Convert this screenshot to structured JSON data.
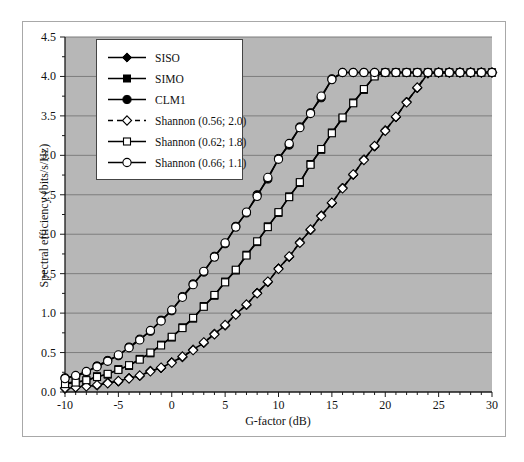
{
  "figure": {
    "background": "#ffffff",
    "frame_border": "#a8a8a8",
    "plot_bg": "#b7b7b7",
    "gridline_color": "#7d7d7d",
    "axis_color": "#1a1a1a",
    "series_color": "#000000"
  },
  "chart_data": {
    "type": "line",
    "title": "",
    "xlabel": "G-factor (dB)",
    "ylabel": "Spectral efficiency (bits/s/Hz)",
    "xlim": [
      -10,
      30
    ],
    "ylim": [
      0,
      4.5
    ],
    "grid": "horizontal-major",
    "legend_position": "top-left-inside",
    "x_ticks": {
      "values": [
        -10,
        -5,
        0,
        5,
        10,
        15,
        20,
        25,
        30
      ],
      "labels": [
        "-10",
        "-5",
        "0",
        "5",
        "10",
        "15",
        "20",
        "25",
        "30"
      ],
      "minor_step": 1
    },
    "y_ticks": {
      "values": [
        0,
        0.5,
        1,
        1.5,
        2,
        2.5,
        3,
        3.5,
        4,
        4.5
      ],
      "labels": [
        "0.0",
        "0.5",
        "1.0",
        "1.5",
        "2.0",
        "2.5",
        "3.0",
        "3.5",
        "4.0",
        "4.5"
      ],
      "minor_step": 0.25
    },
    "x": [
      -10,
      -9,
      -8,
      -7,
      -6,
      -5,
      -4,
      -3,
      -2,
      -1,
      0,
      1,
      2,
      3,
      4,
      5,
      6,
      7,
      8,
      9,
      10,
      11,
      12,
      13,
      14,
      15,
      16,
      17,
      18,
      19,
      20,
      21,
      22,
      23,
      24,
      25,
      26,
      27,
      28,
      29,
      30
    ],
    "saturation_level": 4.05,
    "series": [
      {
        "name": "SISO",
        "marker": "diamond",
        "marker_fill": "filled",
        "line": "solid",
        "values": [
          0.04,
          0.06,
          0.08,
          0.08,
          0.12,
          0.13,
          0.18,
          0.2,
          0.27,
          0.3,
          0.38,
          0.44,
          0.54,
          0.62,
          0.74,
          0.84,
          0.99,
          1.1,
          1.26,
          1.39,
          1.57,
          1.71,
          1.9,
          2.05,
          2.24,
          2.39,
          2.59,
          2.75,
          2.95,
          3.11,
          3.32,
          3.48,
          3.68,
          3.85,
          4.04,
          4.05,
          4.05,
          4.05,
          4.05,
          4.05,
          4.05
        ]
      },
      {
        "name": "SIMO",
        "marker": "square",
        "marker_fill": "filled",
        "line": "solid",
        "values": [
          0.11,
          0.13,
          0.14,
          0.2,
          0.22,
          0.29,
          0.33,
          0.42,
          0.49,
          0.6,
          0.69,
          0.82,
          0.93,
          1.09,
          1.22,
          1.4,
          1.54,
          1.74,
          1.9,
          2.1,
          2.27,
          2.48,
          2.65,
          2.89,
          3.07,
          3.29,
          3.47,
          3.67,
          3.83,
          4.01,
          4.05,
          4.05,
          4.05,
          4.05,
          4.05,
          4.05,
          4.05,
          4.05,
          4.05,
          4.05,
          4.05
        ]
      },
      {
        "name": "CLM1",
        "marker": "circle",
        "marker_fill": "filled",
        "line": "solid",
        "values": [
          0.18,
          0.2,
          0.25,
          0.33,
          0.4,
          0.46,
          0.57,
          0.67,
          0.77,
          0.91,
          1.03,
          1.21,
          1.37,
          1.52,
          1.72,
          1.88,
          2.1,
          2.27,
          2.5,
          2.7,
          2.96,
          3.13,
          3.36,
          3.54,
          3.73,
          3.97,
          4.05,
          4.05,
          4.05,
          4.05,
          4.05,
          4.05,
          4.05,
          4.05,
          4.05,
          4.05,
          4.05,
          4.05,
          4.05,
          4.05,
          4.05
        ]
      },
      {
        "name": "Shannon (0.56; 2.0)",
        "marker": "diamond",
        "marker_fill": "open",
        "line": "dashed",
        "values": [
          0.05,
          0.06,
          0.07,
          0.09,
          0.11,
          0.14,
          0.17,
          0.21,
          0.26,
          0.31,
          0.37,
          0.45,
          0.53,
          0.63,
          0.73,
          0.85,
          0.98,
          1.11,
          1.25,
          1.4,
          1.56,
          1.72,
          1.89,
          2.06,
          2.23,
          2.4,
          2.58,
          2.76,
          2.94,
          3.12,
          3.31,
          3.49,
          3.67,
          3.86,
          4.04,
          4.05,
          4.05,
          4.05,
          4.05,
          4.05,
          4.05
        ]
      },
      {
        "name": "Shannon (0.62; 1.8)",
        "marker": "square",
        "marker_fill": "open",
        "line": "solid",
        "values": [
          0.1,
          0.12,
          0.15,
          0.19,
          0.23,
          0.28,
          0.34,
          0.41,
          0.5,
          0.59,
          0.7,
          0.81,
          0.94,
          1.08,
          1.23,
          1.39,
          1.55,
          1.73,
          1.91,
          2.09,
          2.28,
          2.47,
          2.66,
          2.88,
          3.08,
          3.28,
          3.48,
          3.66,
          3.84,
          4.0,
          4.05,
          4.05,
          4.05,
          4.05,
          4.05,
          4.05,
          4.05,
          4.05,
          4.05,
          4.05,
          4.05
        ]
      },
      {
        "name": "Shannon (0.66; 1.1)",
        "marker": "circle",
        "marker_fill": "open",
        "line": "solid",
        "values": [
          0.17,
          0.21,
          0.26,
          0.32,
          0.39,
          0.47,
          0.56,
          0.66,
          0.78,
          0.9,
          1.04,
          1.2,
          1.36,
          1.53,
          1.71,
          1.89,
          2.09,
          2.28,
          2.48,
          2.72,
          2.95,
          3.15,
          3.35,
          3.53,
          3.75,
          3.96,
          4.05,
          4.05,
          4.05,
          4.05,
          4.05,
          4.05,
          4.05,
          4.05,
          4.05,
          4.05,
          4.05,
          4.05,
          4.05,
          4.05,
          4.05
        ]
      }
    ]
  },
  "legend": {
    "items": [
      {
        "label": "SISO"
      },
      {
        "label": "SIMO"
      },
      {
        "label": "CLM1"
      },
      {
        "label": "Shannon (0.56; 2.0)"
      },
      {
        "label": "Shannon (0.62; 1.8)"
      },
      {
        "label": "Shannon (0.66; 1.1)"
      }
    ]
  }
}
